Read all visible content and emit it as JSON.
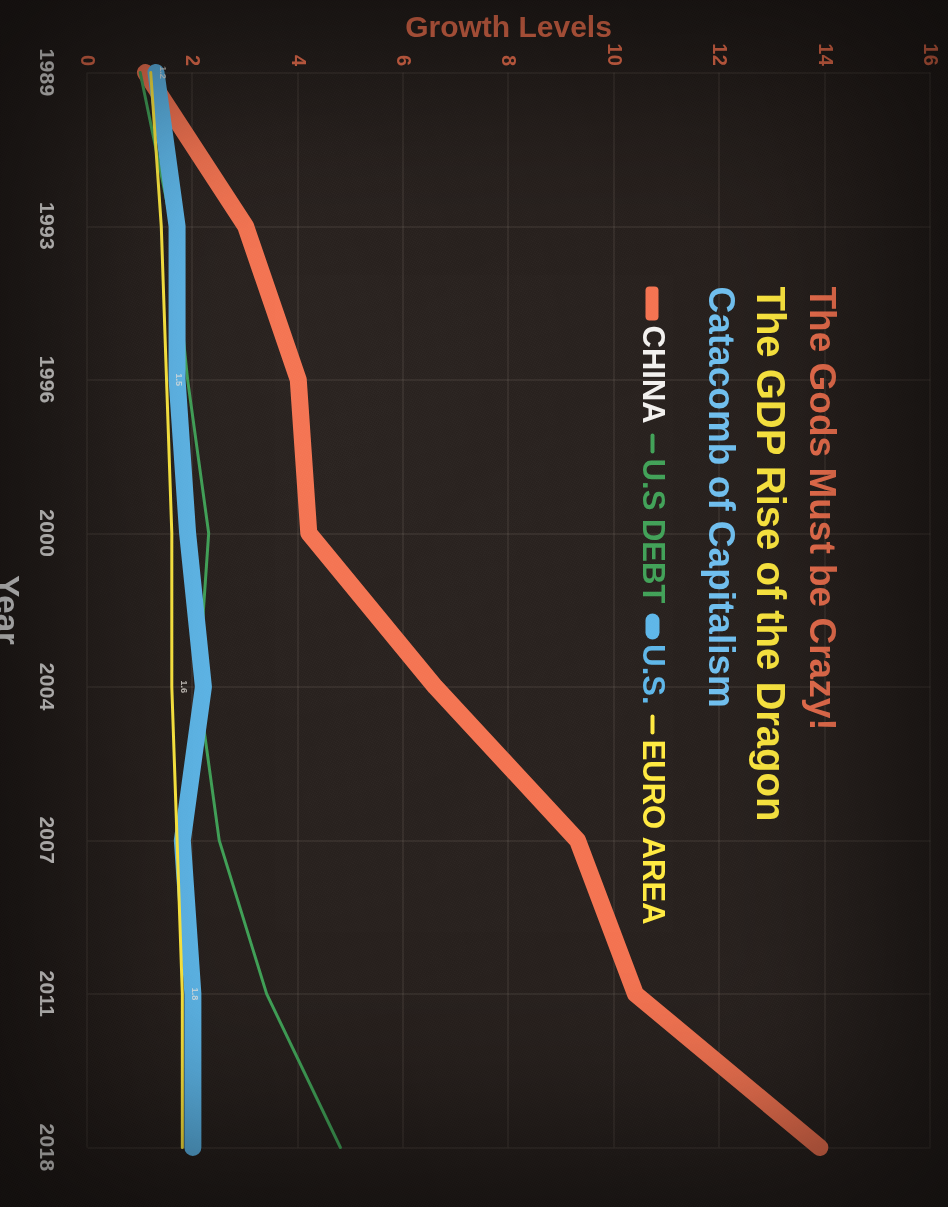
{
  "title": {
    "line1": "The Gods Must be Crazy!",
    "line2": "The GDP Rise of the Dragon",
    "line3": "Catacomb of Capitalism",
    "color1": "#f4714e",
    "color2": "#ffe93d",
    "color3": "#6fc0f0"
  },
  "legend": {
    "items": [
      {
        "label": "CHINA",
        "color": "#f2f0ee",
        "line_color": "#f4714e"
      },
      {
        "label": "U.S DEBT",
        "color": "#3ea055",
        "line_color": "#3ea055"
      },
      {
        "label": "U.S.",
        "color": "#5bb5e8",
        "line_color": "#5bb5e8"
      },
      {
        "label": "EURO AREA",
        "color": "#ffe93d",
        "line_color": "#ffe93d"
      }
    ]
  },
  "axes": {
    "x_title": "Year",
    "y_title": "Growth Levels",
    "y_title_color": "#f4714e",
    "x_title_color": "#ffffff",
    "y_ticks": [
      0,
      2,
      4,
      6,
      8,
      10,
      12,
      14,
      16
    ],
    "y_tick_color": "#f4714e",
    "x_ticks": [
      "1989",
      "1993",
      "1996",
      "2000",
      "2004",
      "2007",
      "2011",
      "2018"
    ],
    "x_tick_color": "#f2f0ee",
    "grid": true,
    "background": "#241d1a"
  },
  "chart_data": {
    "type": "line",
    "xlabel": "Year",
    "ylabel": "Growth Levels",
    "ylim": [
      0,
      16
    ],
    "grid": true,
    "legend_position": "top-left",
    "orientation": "rotated-90",
    "x": [
      "1989",
      "1993",
      "1996",
      "2000",
      "2004",
      "2007",
      "2011",
      "2018"
    ],
    "series": [
      {
        "name": "CHINA",
        "color": "#f4714e",
        "width": "thick",
        "values": [
          1.1,
          3.0,
          4.0,
          4.2,
          6.6,
          9.3,
          10.4,
          13.9
        ]
      },
      {
        "name": "U.S DEBT",
        "color": "#3ea055",
        "width": "thin",
        "values": [
          1.0,
          1.6,
          1.9,
          2.3,
          2.1,
          2.5,
          3.4,
          4.8
        ]
      },
      {
        "name": "U.S.",
        "color": "#5bb5e8",
        "width": "thick",
        "values": [
          1.3,
          1.7,
          1.7,
          1.9,
          2.2,
          1.8,
          2.0,
          2.0
        ]
      },
      {
        "name": "EURO AREA",
        "color": "#ffe93d",
        "width": "thin",
        "values": [
          1.2,
          1.4,
          1.5,
          1.6,
          1.6,
          1.7,
          1.8,
          1.8
        ]
      }
    ]
  }
}
